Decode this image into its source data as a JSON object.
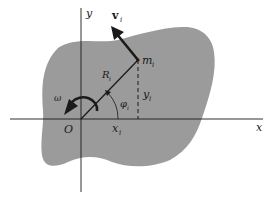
{
  "figure": {
    "kind": "rigid-body rotation about origin",
    "colors": {
      "body_fill": "#9b9b9b",
      "ink": "#1a1a1a",
      "background": "#ffffff"
    },
    "labels": {
      "y_axis": "y",
      "x_axis": "x",
      "origin": "O",
      "velocity": "v",
      "velocity_sub": "i",
      "mass": "m",
      "mass_sub": "i",
      "radius": "R",
      "radius_sub": "i",
      "y_coord": "y",
      "y_coord_sub": "i",
      "x_coord": "x",
      "x_coord_sub": "i",
      "angle": "φ",
      "angle_sub": "i",
      "angular_velocity": "ω"
    }
  }
}
